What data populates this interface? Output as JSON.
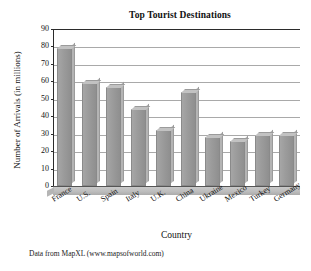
{
  "chart_data": {
    "type": "bar",
    "title": "Top Tourist Destinations",
    "xlabel": "Country",
    "ylabel": "Number of Arrivals (in millions)",
    "categories": [
      "France",
      "U.S.",
      "Spain",
      "Italy",
      "U.K.",
      "China",
      "Ukraine",
      "Mexico",
      "Turkey",
      "Germany"
    ],
    "values": [
      79,
      59,
      57,
      44,
      32,
      54,
      28,
      26,
      29,
      29
    ],
    "ylim": [
      0,
      90
    ],
    "ytick_labels": [
      "90",
      "80",
      "70",
      "60",
      "50",
      "40",
      "30",
      "20",
      "10",
      "0"
    ],
    "ytick_values": [
      90,
      80,
      70,
      60,
      50,
      40,
      30,
      20,
      10,
      0
    ],
    "ystep": 10,
    "grid": true,
    "legend": "none",
    "bar_color": "#9c9c9c",
    "bar_top_color": "#c2c2c2",
    "bar_side_color": "#b4b4b4",
    "gridline_color": "#a9a9a9",
    "axis_color": "#2b2b2b",
    "plot_background": "#ffffff",
    "source_note": "Data from MapXL (www.mapsofworld.com)"
  }
}
